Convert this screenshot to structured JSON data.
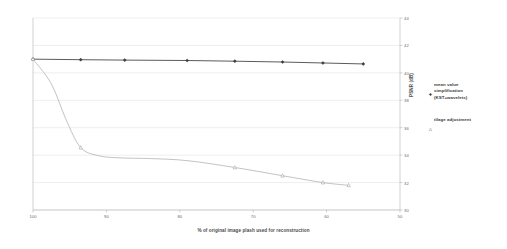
{
  "chart_data": {
    "type": "line",
    "title": "",
    "xlabel": "% of original image plash used for reconstruction",
    "ylabel": "PSNR (dB)",
    "xlim": [
      100,
      50
    ],
    "ylim": [
      30,
      44
    ],
    "x_reversed": true,
    "xticks": [
      100,
      90,
      80,
      70,
      60,
      50
    ],
    "yticks": [
      30,
      32,
      34,
      36,
      38,
      40,
      42,
      44
    ],
    "grid": true,
    "legend_position": "right",
    "series": [
      {
        "name": "mean value\nsimplification\n(KST+wavelets)",
        "marker": "filled-diamond",
        "color": "#3d3d3d",
        "x": [
          100,
          93.5,
          87.5,
          79,
          72.5,
          66,
          60.5,
          55
        ],
        "y": [
          41.0,
          40.96,
          40.93,
          40.9,
          40.85,
          40.79,
          40.72,
          40.65
        ]
      },
      {
        "name": "tilage adjustment",
        "marker": "open-triangle",
        "color": "#9a9a9a",
        "x": [
          100,
          97.5,
          95.5,
          93.5,
          91,
          88,
          84,
          79,
          72.5,
          66,
          60.5,
          57
        ],
        "y": [
          41.0,
          39.2,
          36.6,
          34.55,
          33.95,
          33.8,
          33.75,
          33.6,
          33.1,
          32.5,
          32.0,
          31.8
        ]
      }
    ]
  }
}
